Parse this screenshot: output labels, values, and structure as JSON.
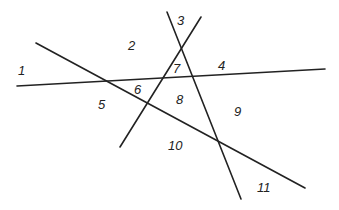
{
  "diagram": {
    "line_color": "#222222",
    "lines": [
      {
        "id": "line-a",
        "x1": 17,
        "y1": 86,
        "x2": 325,
        "y2": 69
      },
      {
        "id": "line-b",
        "x1": 36,
        "y1": 43,
        "x2": 305,
        "y2": 188
      },
      {
        "id": "line-c",
        "x1": 167,
        "y1": 12,
        "x2": 241,
        "y2": 199
      },
      {
        "id": "line-d",
        "x1": 201,
        "y1": 17,
        "x2": 120,
        "y2": 147
      }
    ],
    "regions": [
      {
        "label": "1",
        "x": 18,
        "y": 75
      },
      {
        "label": "2",
        "x": 128,
        "y": 51
      },
      {
        "label": "3",
        "x": 177,
        "y": 26
      },
      {
        "label": "4",
        "x": 218,
        "y": 71
      },
      {
        "label": "5",
        "x": 98,
        "y": 110
      },
      {
        "label": "6",
        "x": 134,
        "y": 95
      },
      {
        "label": "7",
        "x": 176,
        "y": 102
      },
      {
        "label": "8",
        "x": 176,
        "y": 104
      },
      {
        "label": "9",
        "x": 234,
        "y": 117
      },
      {
        "label": "10",
        "x": 168,
        "y": 151
      },
      {
        "label": "11",
        "x": 257,
        "y": 193
      }
    ]
  }
}
